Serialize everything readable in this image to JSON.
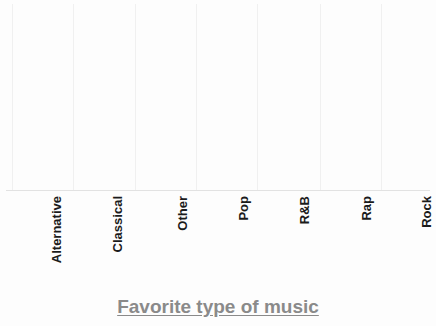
{
  "chart_data": {
    "type": "scatter",
    "plot_style": "dot-plot",
    "title": "Favorite type of music",
    "xlabel": "Favorite type of music",
    "ylabel": "",
    "categories": [
      "Alternative",
      "Classical",
      "Other",
      "Pop",
      "R&B",
      "Rap",
      "Rock"
    ],
    "values": [
      2,
      1,
      3,
      3,
      5,
      6,
      6
    ],
    "unit": "dots (count of responses)",
    "ylim": [
      0,
      7
    ],
    "grid": "vertical-only",
    "legend": "none",
    "annotations": [],
    "colors": {
      "dot_fill": "#dedede",
      "dot_stroke": "#4f4f4f",
      "gridline": "#f0f0f0",
      "baseline": "#e2e2e2",
      "label_text": "#1b1b1b",
      "title_text": "#8a8a8a",
      "background": "#fdfdfd"
    }
  },
  "axis": {
    "title": "Favorite type of music"
  },
  "columns": [
    {
      "label": "Alternative",
      "count": 2,
      "center_x": 42,
      "gridline_x": 12
    },
    {
      "label": "Classical",
      "count": 1,
      "center_x": 103,
      "gridline_x": 73
    },
    {
      "label": "Other",
      "count": 3,
      "center_x": 168,
      "gridline_x": 135
    },
    {
      "label": "Pop",
      "count": 3,
      "center_x": 229,
      "gridline_x": 196
    },
    {
      "label": "R&B",
      "count": 5,
      "center_x": 290,
      "gridline_x": 257
    },
    {
      "label": "Rap",
      "count": 6,
      "center_x": 352,
      "gridline_x": 320
    },
    {
      "label": "Rock",
      "count": 6,
      "center_x": 412,
      "gridline_x": 381
    }
  ]
}
